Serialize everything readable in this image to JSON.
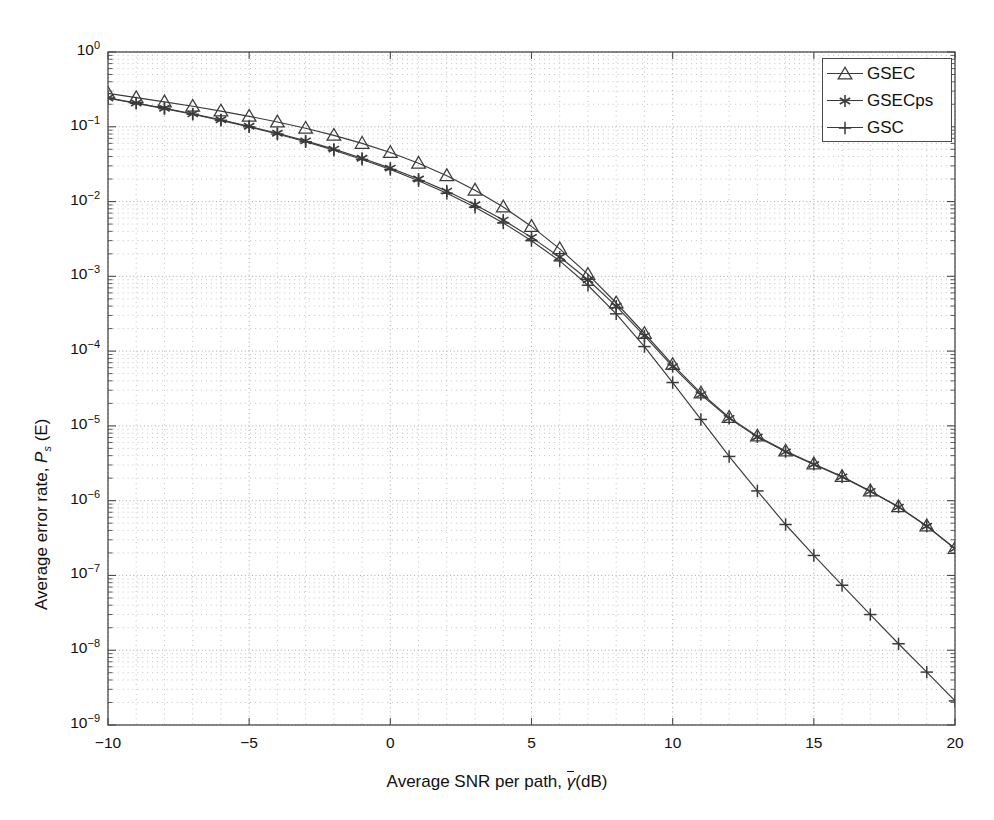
{
  "figure": {
    "background": "#ffffff",
    "plot_area": {
      "left": 108,
      "top": 52,
      "right": 955,
      "bottom": 725
    },
    "axis_color": "#4a4a4a",
    "grid_color": "#9a9a9a",
    "curve_color": "#3a3a3a"
  },
  "legend": {
    "position": "top-right",
    "entries": [
      {
        "label": "GSEC",
        "marker": "triangle-up"
      },
      {
        "label": "GSECps",
        "marker": "asterisk"
      },
      {
        "label": "GSC",
        "marker": "plus"
      }
    ]
  },
  "axis_text": {
    "xlabel_prefix": "Average SNR per path, ",
    "xlabel_gamma": "γ",
    "xlabel_suffix": "(dB)",
    "ylabel_prefix": "Average error rate, ",
    "ylabel_P": "P",
    "ylabel_sub": "s",
    "ylabel_suffix": " (E)"
  },
  "xticks": [
    {
      "value": -10,
      "label": "−10"
    },
    {
      "value": -5,
      "label": "−5"
    },
    {
      "value": 0,
      "label": "0"
    },
    {
      "value": 5,
      "label": "5"
    },
    {
      "value": 10,
      "label": "10"
    },
    {
      "value": 15,
      "label": "15"
    },
    {
      "value": 20,
      "label": "20"
    }
  ],
  "yticks": [
    {
      "exp": 0,
      "mantissa": "10",
      "label": "0"
    },
    {
      "exp": -1,
      "mantissa": "10",
      "label": "−1"
    },
    {
      "exp": -2,
      "mantissa": "10",
      "label": "−2"
    },
    {
      "exp": -3,
      "mantissa": "10",
      "label": "−3"
    },
    {
      "exp": -4,
      "mantissa": "10",
      "label": "−4"
    },
    {
      "exp": -5,
      "mantissa": "10",
      "label": "−5"
    },
    {
      "exp": -6,
      "mantissa": "10",
      "label": "−6"
    },
    {
      "exp": -7,
      "mantissa": "10",
      "label": "−7"
    },
    {
      "exp": -8,
      "mantissa": "10",
      "label": "−8"
    },
    {
      "exp": -9,
      "mantissa": "10",
      "label": "−9"
    }
  ],
  "chart_data": {
    "type": "line",
    "title": "",
    "xlabel": "Average SNR per path, γ̄ (dB)",
    "ylabel": "Average error rate, Ps (E)",
    "xlim": [
      -10,
      20
    ],
    "ylim": [
      1e-09,
      1
    ],
    "yscale": "log",
    "xscale": "linear",
    "grid": true,
    "grid_minor": true,
    "legend_position": "upper right",
    "x": [
      -10,
      -9,
      -8,
      -7,
      -6,
      -5,
      -4,
      -3,
      -2,
      -1,
      0,
      1,
      2,
      3,
      4,
      5,
      6,
      7,
      8,
      9,
      10,
      11,
      12,
      13,
      14,
      15,
      16,
      17,
      18,
      19,
      20
    ],
    "series": [
      {
        "name": "GSEC",
        "marker": "triangle-up",
        "values": [
          0.28,
          0.245,
          0.215,
          0.188,
          0.162,
          0.138,
          0.116,
          0.0955,
          0.0768,
          0.06,
          0.0452,
          0.0326,
          0.0222,
          0.0142,
          0.00845,
          0.00465,
          0.00233,
          0.00106,
          0.00044,
          0.000172,
          6.6e-05,
          2.75e-05,
          1.3e-05,
          7.3e-06,
          4.6e-06,
          3.1e-06,
          2.1e-06,
          1.35e-06,
          8.3e-07,
          4.6e-07,
          2.3e-07
        ]
      },
      {
        "name": "GSECps",
        "marker": "asterisk",
        "values": [
          0.243,
          0.208,
          0.177,
          0.149,
          0.124,
          0.1015,
          0.0818,
          0.0648,
          0.0502,
          0.038,
          0.028,
          0.02,
          0.0138,
          0.00905,
          0.00565,
          0.00332,
          0.00181,
          0.0009,
          0.0004,
          0.00016,
          6.2e-05,
          2.62e-05,
          1.26e-05,
          7.1e-06,
          4.5e-06,
          3.05e-06,
          2.08e-06,
          1.33e-06,
          8.2e-07,
          4.55e-07,
          2.28e-07
        ]
      },
      {
        "name": "GSC",
        "marker": "plus",
        "values": [
          0.241,
          0.206,
          0.175,
          0.147,
          0.122,
          0.0998,
          0.08,
          0.063,
          0.0486,
          0.0366,
          0.0268,
          0.019,
          0.0129,
          0.0084,
          0.00518,
          0.003,
          0.00161,
          0.00076,
          0.000315,
          0.000115,
          3.8e-05,
          1.22e-05,
          3.9e-06,
          1.35e-06,
          4.8e-07,
          1.85e-07,
          7.4e-08,
          3e-08,
          1.22e-08,
          5.1e-09,
          2.1e-09
        ]
      }
    ]
  }
}
